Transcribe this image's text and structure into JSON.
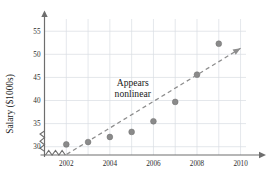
{
  "chart_data": {
    "type": "scatter",
    "title": "",
    "xlabel": "",
    "ylabel": "Salary ($1000s)",
    "x": [
      2002,
      2003,
      2004,
      2005,
      2006,
      2007,
      2008,
      2009
    ],
    "values": [
      30.5,
      31.0,
      32.1,
      33.2,
      35.5,
      39.7,
      45.6,
      52.3
    ],
    "series": [
      {
        "name": "Salary",
        "values": [
          30.5,
          31.0,
          32.1,
          33.2,
          35.5,
          39.7,
          45.6,
          52.3
        ]
      }
    ],
    "xlim": [
      2001,
      2010.8
    ],
    "ylim": [
      28.2,
      57.0
    ],
    "xticks": [
      2002,
      2004,
      2006,
      2008,
      2010
    ],
    "yticks": [
      30,
      35,
      40,
      45,
      50,
      55
    ],
    "xtick_labels": [
      "2002",
      "2004",
      "2006",
      "2008",
      "2010"
    ],
    "ytick_labels": [
      "30",
      "35",
      "40",
      "45",
      "50",
      "55"
    ],
    "grid": true,
    "legend": "none",
    "axis_break": true,
    "annotations": [
      {
        "name": "appears-nonlinear",
        "line1": "Appears",
        "line2": "nonlinear",
        "x": 2005.05,
        "y": 43.2
      }
    ],
    "trendline": {
      "type": "dashed-reference-line",
      "arrow": true,
      "x_start": 2002.02,
      "y_start": 28.35,
      "x_end": 2010.0,
      "y_end": 51.3
    },
    "colors": {
      "point": "#8a8a8a",
      "axis": "#6e6e6e",
      "grid": "#d9dde3",
      "trend": "#8d8d8d",
      "text": "#1a1a1a",
      "background": "#ffffff"
    }
  }
}
